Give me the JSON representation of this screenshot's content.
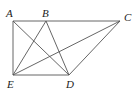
{
  "diagram": {
    "points": {
      "A": {
        "label": "A",
        "x": 13,
        "y": 21,
        "lx": 6,
        "ly": 17
      },
      "B": {
        "label": "B",
        "x": 46,
        "y": 21,
        "lx": 42,
        "ly": 17
      },
      "C": {
        "label": "C",
        "x": 120,
        "y": 21,
        "lx": 124,
        "ly": 21
      },
      "E": {
        "label": "E",
        "x": 13,
        "y": 75,
        "lx": 7,
        "ly": 88
      },
      "D": {
        "label": "D",
        "x": 69,
        "y": 75,
        "lx": 66,
        "ly": 88
      }
    },
    "segments": [
      [
        "A",
        "C"
      ],
      [
        "A",
        "E"
      ],
      [
        "E",
        "D"
      ],
      [
        "D",
        "C"
      ],
      [
        "A",
        "D"
      ],
      [
        "B",
        "E"
      ],
      [
        "B",
        "D"
      ],
      [
        "E",
        "C"
      ]
    ]
  }
}
